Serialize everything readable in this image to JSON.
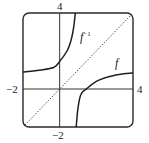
{
  "chart_data": {
    "type": "line",
    "title": "",
    "xlabel": "",
    "ylabel": "",
    "xlim": [
      -2,
      4
    ],
    "ylim": [
      -2,
      4
    ],
    "grid": false,
    "legend": "none",
    "axes": {
      "x_axis_at_y": 0,
      "y_axis_at_x": 0
    },
    "tick_labels": {
      "x_left": "−2",
      "x_right": "4",
      "y_top": "4",
      "y_bottom": "−2"
    },
    "series": [
      {
        "name": "f",
        "label": "f",
        "style": "solid",
        "description": "Rational function with vertical asymptote near x = 0.9 and horizontal asymptote near y = 0.9; branch in lower-right region",
        "points": [
          [
            0.9,
            -2.0
          ],
          [
            1.0,
            -1.0
          ],
          [
            1.15,
            -0.3
          ],
          [
            1.45,
            0.0
          ],
          [
            2.0,
            0.4
          ],
          [
            2.5,
            0.6
          ],
          [
            3.0,
            0.72
          ],
          [
            3.5,
            0.8
          ],
          [
            4.0,
            0.85
          ]
        ]
      },
      {
        "name": "f_inverse",
        "label": "f",
        "label_superscript": "−1",
        "style": "solid",
        "description": "Inverse function, reflection of f across y = x; branch in upper-left region",
        "points": [
          [
            -2.0,
            0.9
          ],
          [
            -1.0,
            1.0
          ],
          [
            -0.3,
            1.15
          ],
          [
            0.0,
            1.45
          ],
          [
            0.4,
            2.0
          ],
          [
            0.6,
            2.5
          ],
          [
            0.72,
            3.0
          ],
          [
            0.8,
            3.5
          ],
          [
            0.85,
            4.0
          ]
        ]
      },
      {
        "name": "identity",
        "label": "y = x",
        "style": "dotted",
        "points": [
          [
            -2,
            -2
          ],
          [
            4,
            4
          ]
        ]
      }
    ]
  },
  "labels": {
    "y_top": "4",
    "y_bottom": "−2",
    "x_left": "−2",
    "x_right": "4",
    "f": "f",
    "f_inv_base": "f",
    "f_inv_sup": "−1"
  }
}
